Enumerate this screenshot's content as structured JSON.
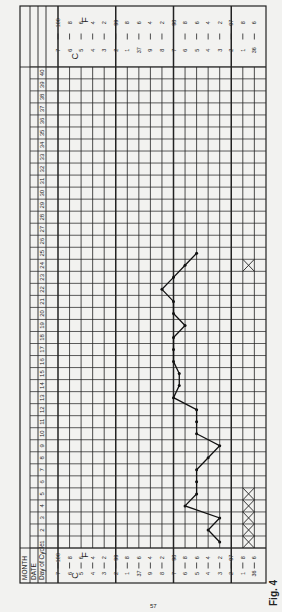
{
  "header": {
    "month_label": "MONTH",
    "date_label": "DATE",
    "day_of_cycle_label": "Day of Cycle"
  },
  "figure_label": "Fig. 4",
  "page_number": "57",
  "scale": {
    "celsius_unit": "C",
    "fahrenheit_unit": "F",
    "fahrenheit_ticks": [
      "100",
      "8",
      "6",
      "4",
      "2",
      "99",
      "8",
      "6",
      "4",
      "2",
      "98",
      "8",
      "6",
      "4",
      "2",
      "97",
      "8",
      "6"
    ],
    "celsius_ticks": [
      "7",
      "6",
      "5",
      "4",
      "3",
      "2",
      "1",
      "37",
      "9",
      "8",
      "7",
      "6",
      "5",
      "4",
      "3",
      "2",
      "1",
      "36"
    ]
  },
  "chart_data": {
    "type": "line",
    "xlabel": "Day of Cycle",
    "ylabel": "Temperature (°F)",
    "orientation": "rotated 90° counter-clockwise (day axis vertical, temperature horizontal)",
    "x": [
      1,
      2,
      3,
      4,
      5,
      6,
      7,
      8,
      9,
      10,
      11,
      12,
      13,
      14,
      15,
      16,
      17,
      18,
      19,
      20,
      21,
      22,
      23,
      24,
      25
    ],
    "series": [
      {
        "name": "Basal temperature (°F)",
        "values": [
          97.2,
          97.4,
          97.2,
          97.8,
          97.6,
          97.6,
          97.6,
          97.4,
          97.2,
          97.6,
          97.6,
          97.6,
          98.0,
          97.9,
          97.9,
          98.0,
          98.0,
          98.0,
          97.8,
          98.0,
          98.0,
          98.2,
          98.0,
          97.8,
          97.6
        ]
      }
    ],
    "markers": [
      {
        "type": "menstruation-crosses",
        "days": [
          1,
          2,
          3,
          4,
          5
        ]
      },
      {
        "type": "cross",
        "days": [
          24
        ]
      }
    ],
    "day_range": [
      1,
      40
    ],
    "ylim": [
      96.6,
      100.0
    ],
    "grid": true,
    "major_lines_f": [
      100,
      99,
      98,
      97
    ]
  }
}
